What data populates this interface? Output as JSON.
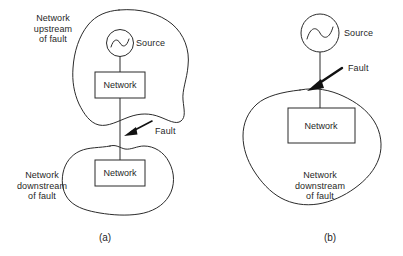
{
  "figure": {
    "background_color": "#ffffff",
    "line_color": "#2b2b2b"
  },
  "panels": [
    {
      "id": "a",
      "caption": "(a)",
      "upstream_label": "Network\nupstream\nof fault",
      "downstream_label": "Network\ndownstream\nof fault",
      "source_label": "Source",
      "fault_label": "Fault",
      "upstream_network_box_label": "Network",
      "downstream_network_box_label": "Network",
      "source_symbol": "ac-source-sine"
    },
    {
      "id": "b",
      "caption": "(b)",
      "downstream_label": "Network\ndownstream\nof fault",
      "source_label": "Source",
      "fault_label": "Fault",
      "network_box_label": "Network",
      "source_symbol": "ac-source-sine"
    }
  ]
}
